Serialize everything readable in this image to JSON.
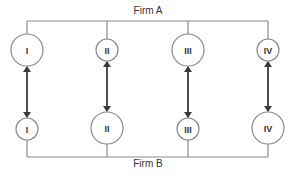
{
  "diagram": {
    "top_firm": {
      "label": "Firm A",
      "x": 148,
      "y": 14,
      "bus_y": 21
    },
    "bottom_firm": {
      "label": "Firm B",
      "x": 148,
      "y": 167,
      "bus_y": 157
    },
    "bus_x_start": 27,
    "bus_x_end": 268,
    "colors": {
      "line": "#8a8a8a",
      "arrow": "#3a3a3a",
      "text": "#333333",
      "background": "#ffffff"
    },
    "columns": [
      {
        "id": "I",
        "x": 27,
        "top": {
          "label": "I",
          "r": 16,
          "cy": 50
        },
        "bottom": {
          "label": "I",
          "r": 11,
          "cy": 129
        }
      },
      {
        "id": "II",
        "x": 107,
        "top": {
          "label": "II",
          "r": 11,
          "cy": 50
        },
        "bottom": {
          "label": "II",
          "r": 16,
          "cy": 128
        }
      },
      {
        "id": "III",
        "x": 188,
        "top": {
          "label": "III",
          "r": 16,
          "cy": 50
        },
        "bottom": {
          "label": "III",
          "r": 11,
          "cy": 129
        }
      },
      {
        "id": "IV",
        "x": 268,
        "top": {
          "label": "IV",
          "r": 11,
          "cy": 50
        },
        "bottom": {
          "label": "IV",
          "r": 16,
          "cy": 128
        }
      }
    ],
    "connection": "bidirectional-arrow"
  }
}
